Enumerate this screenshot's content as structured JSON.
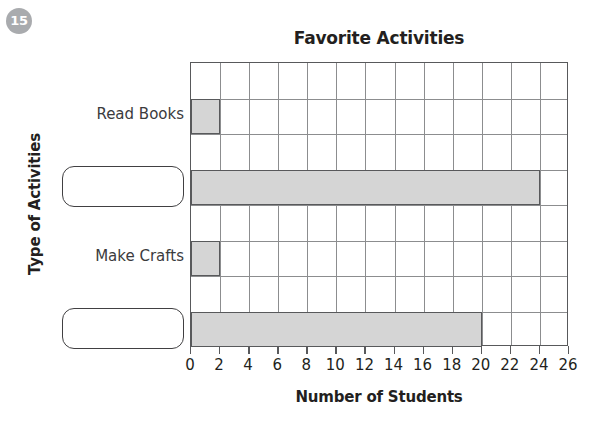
{
  "badge": {
    "number": "15"
  },
  "chart_data": {
    "type": "bar",
    "orientation": "horizontal",
    "title": "Favorite Activities",
    "xlabel": "Number of Students",
    "ylabel": "Type of Activities",
    "categories": [
      "Read Books",
      "",
      "Make Crafts",
      ""
    ],
    "values": [
      2,
      24,
      2,
      20
    ],
    "xlim": [
      0,
      26
    ],
    "xticks": [
      0,
      2,
      4,
      6,
      8,
      10,
      12,
      14,
      16,
      18,
      20,
      22,
      24,
      26
    ],
    "xtick_labels": [
      "0",
      "2",
      "4",
      "6",
      "8",
      "10",
      "12",
      "14",
      "16",
      "18",
      "20",
      "22",
      "24",
      "26"
    ],
    "grid": true,
    "legend": "none",
    "bar_fill_color": "#d5d5d5",
    "bar_border_color": "#58595b",
    "grid_color": "#8c8d8f",
    "blank_categories": [
      1,
      3
    ]
  }
}
